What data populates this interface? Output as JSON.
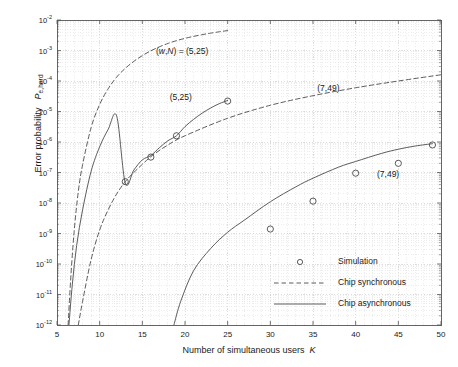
{
  "chart_data": {
    "type": "line",
    "title": "",
    "xlabel": "Number of simultaneous users   K",
    "ylabel": "Error probability   P e,hard",
    "xlim": [
      5,
      50
    ],
    "ylim": [
      1e-12,
      0.01
    ],
    "yscale": "log",
    "xticks": [
      5,
      10,
      15,
      20,
      25,
      30,
      35,
      40,
      45,
      50
    ],
    "xtick_labels": [
      "5",
      "10",
      "15",
      "20",
      "25",
      "30",
      "35",
      "40",
      "45",
      "50"
    ],
    "ytick_labels": [
      "10-2",
      "10-3",
      "10-4",
      "10-5",
      "10-6",
      "10-7",
      "10-8",
      "10-9",
      "10-10",
      "10-11",
      "10-12"
    ],
    "ytick_exponents": [
      -2,
      -3,
      -4,
      -5,
      -6,
      -7,
      -8,
      -9,
      -10,
      -11,
      -12
    ],
    "grid": true,
    "grid_minor": true,
    "legend_position": "lower right",
    "series": [
      {
        "name": "Chip synchronous (5,25)",
        "style": "dashed",
        "label": "(w,N) = (5,25)",
        "x": [
          6.3,
          6.6,
          7,
          7.5,
          8,
          9,
          10,
          11,
          12,
          13,
          14,
          15,
          16,
          17,
          18,
          19,
          20,
          21,
          22,
          23,
          24,
          25
        ],
        "y": [
          1e-12,
          3e-11,
          1.1e-09,
          2.4e-08,
          1.8e-07,
          3e-06,
          1.7e-05,
          5.6e-05,
          0.000135,
          0.00026,
          0.00044,
          0.00068,
          0.00098,
          0.00132,
          0.0017,
          0.0021,
          0.0025,
          0.0029,
          0.0033,
          0.0037,
          0.0041,
          0.0045
        ]
      },
      {
        "name": "Chip asynchronous (5,25)",
        "style": "solid",
        "label": "(5,25)",
        "x": [
          6.4,
          6.8,
          7.3,
          8,
          9,
          10,
          11,
          12,
          13,
          14,
          15,
          16,
          17,
          18,
          19,
          20,
          21,
          22,
          23,
          24,
          25
        ],
        "y": [
          1e-12,
          2.2e-11,
          4e-10,
          6e-09,
          1.1e-07,
          7e-07,
          2.6e-06,
          7e-06,
          4.5e-08,
          1.2e-07,
          2.6e-07,
          3.6e-07,
          6.5e-07,
          1.1e-06,
          1.6e-06,
          3.2e-06,
          5.5e-06,
          8.8e-06,
          1.3e-05,
          1.8e-05,
          2.3e-05
        ]
      },
      {
        "name": "Chip synchronous (7,49)",
        "style": "dashed",
        "label": "(7,49)",
        "x": [
          7.5,
          8,
          9,
          10,
          11,
          12,
          13,
          14,
          16,
          18,
          20,
          25,
          30,
          35,
          40,
          45,
          50
        ],
        "y": [
          1e-12,
          6e-12,
          1.4e-10,
          1.3e-09,
          6e-09,
          2e-08,
          5e-08,
          1e-07,
          3.3e-07,
          8e-07,
          1.6e-06,
          6e-06,
          1.6e-05,
          3.3e-05,
          6e-05,
          0.0001,
          0.00016
        ]
      },
      {
        "name": "Chip asynchronous (7,49)",
        "style": "solid",
        "label": "(7,49)",
        "x": [
          18.7,
          19.5,
          21,
          23,
          25,
          27,
          30,
          33,
          35,
          38,
          40,
          43,
          45,
          47,
          49
        ],
        "y": [
          1e-12,
          6e-12,
          6e-11,
          3.2e-10,
          1.1e-09,
          2.8e-09,
          1.1e-08,
          3.4e-08,
          6.5e-08,
          1.5e-07,
          2.3e-07,
          4.2e-07,
          5.8e-07,
          7.4e-07,
          8.8e-07
        ]
      },
      {
        "name": "Simulation (5,25)",
        "style": "markers",
        "x": [
          13,
          16,
          19,
          25
        ],
        "y": [
          5e-08,
          3.2e-07,
          1.6e-06,
          2.2e-05
        ]
      },
      {
        "name": "Simulation (7,49)",
        "style": "markers",
        "x": [
          30,
          35,
          40,
          45,
          49
        ],
        "y": [
          1.4e-09,
          1.15e-08,
          9.5e-08,
          2e-07,
          8e-07
        ]
      }
    ],
    "annotations": [
      {
        "text": "(w,N) = (5,25)",
        "x": 16.6,
        "y": 0.0009
      },
      {
        "text": "(5,25)",
        "x": 18.2,
        "y": 2.8e-05
      },
      {
        "text": "(7,49)",
        "x": 35.5,
        "y": 5.5e-05
      },
      {
        "text": "(7,49)",
        "x": 42.5,
        "y": 8.5e-08
      }
    ],
    "legend_entries": [
      {
        "label": "Simulation",
        "style": "marker"
      },
      {
        "label": "Chip synchronous",
        "style": "dashed"
      },
      {
        "label": "Chip asynchronous",
        "style": "solid"
      }
    ],
    "colors": {
      "line": "#4a4a4a",
      "grid": "#c8c8c8",
      "grid_minor": "#dcdcdc",
      "axis": "#555555",
      "text": "#1a1a1a",
      "background": "#ffffff"
    }
  }
}
